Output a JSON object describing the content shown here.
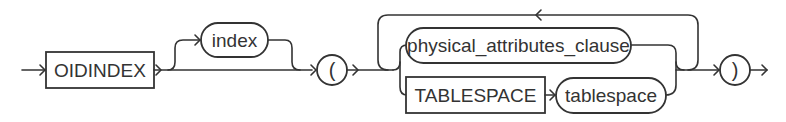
{
  "diagram": {
    "type": "railroad-syntax-diagram",
    "nodes": {
      "oidindex_keyword": {
        "label": "OIDINDEX",
        "kind": "keyword-box"
      },
      "index_param": {
        "label": "index",
        "kind": "nonterminal-pill",
        "optional": true
      },
      "open_paren": {
        "label": "(",
        "kind": "symbol-circle"
      },
      "physical_attributes_clause": {
        "label": "physical_attributes_clause",
        "kind": "nonterminal-pill"
      },
      "tablespace_keyword": {
        "label": "TABLESPACE",
        "kind": "keyword-box"
      },
      "tablespace_param": {
        "label": "tablespace",
        "kind": "nonterminal-pill"
      },
      "close_paren": {
        "label": ")",
        "kind": "symbol-circle"
      }
    },
    "structure": [
      "OIDINDEX",
      "[ index ]",
      "(",
      "{ physical_attributes_clause | TABLESPACE tablespace }...",
      ")"
    ],
    "colors": {
      "stroke": "#333333",
      "background": "#ffffff",
      "text": "#333333"
    }
  }
}
